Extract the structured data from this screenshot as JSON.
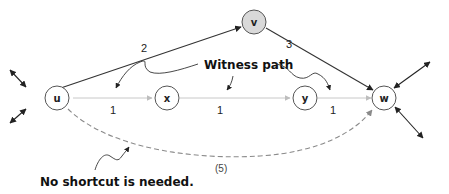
{
  "diagram": {
    "nodes": [
      {
        "id": "u",
        "label": "u",
        "fill": "#ffffff"
      },
      {
        "id": "v",
        "label": "v",
        "fill": "#d9d9d9"
      },
      {
        "id": "w",
        "label": "w",
        "fill": "#ffffff"
      },
      {
        "id": "x",
        "label": "x",
        "fill": "#ffffff"
      },
      {
        "id": "y",
        "label": "y",
        "fill": "#ffffff"
      }
    ],
    "edges": [
      {
        "from": "u",
        "to": "v",
        "weight": "2",
        "style": "solid-dark"
      },
      {
        "from": "v",
        "to": "w",
        "weight": "3",
        "style": "solid-dark"
      },
      {
        "from": "u",
        "to": "x",
        "weight": "1",
        "style": "solid-light"
      },
      {
        "from": "x",
        "to": "y",
        "weight": "1",
        "style": "solid-light"
      },
      {
        "from": "y",
        "to": "w",
        "weight": "1",
        "style": "solid-light"
      },
      {
        "from": "u",
        "to": "w",
        "weight": "(5)",
        "style": "dashed"
      }
    ],
    "annotations": {
      "witness_path": "Witness path",
      "no_shortcut": "No shortcut is needed."
    },
    "colors": {
      "dark_edge": "#333333",
      "light_edge": "#bdbdbd",
      "dashed_edge": "#8a8a8a",
      "node_stroke": "#555555",
      "center_node_fill": "#d9d9d9"
    }
  }
}
